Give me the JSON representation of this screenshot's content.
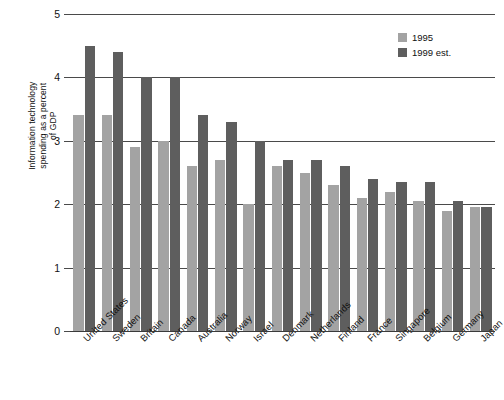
{
  "chart_data": {
    "type": "bar",
    "title": "",
    "subtitle": "",
    "xlabel": "",
    "ylabel": "Information technology\nspending as a percent\nof GDP",
    "ylim": [
      0,
      5
    ],
    "yticks": [
      0,
      1,
      2,
      3,
      4,
      5
    ],
    "ytick_labels": [
      "0",
      "1",
      "2",
      "3",
      "4",
      "5"
    ],
    "grid": true,
    "grid_axis": "y",
    "legend_position": "top-right",
    "categories": [
      "United States",
      "Sweden",
      "Britain",
      "Canada",
      "Australia",
      "Norway",
      "Israel",
      "Denmark",
      "Netherlands",
      "Finland",
      "France",
      "Singapore",
      "Belgium",
      "Germany",
      "Japan"
    ],
    "series": [
      {
        "name": "1995",
        "color": "#a3a3a3",
        "values": [
          3.4,
          3.4,
          2.9,
          3.0,
          2.6,
          2.7,
          2.0,
          2.6,
          2.5,
          2.3,
          2.1,
          2.2,
          2.05,
          1.9,
          1.95
        ]
      },
      {
        "name": "1999 est.",
        "color": "#5e5e5e",
        "values": [
          4.5,
          4.4,
          4.0,
          4.0,
          3.4,
          3.3,
          3.0,
          2.7,
          2.7,
          2.6,
          2.4,
          2.35,
          2.35,
          2.05,
          1.95
        ]
      }
    ]
  },
  "legend": {
    "items": [
      {
        "label": "1995",
        "swatch": "light"
      },
      {
        "label": "1999 est.",
        "swatch": "dark"
      }
    ]
  }
}
